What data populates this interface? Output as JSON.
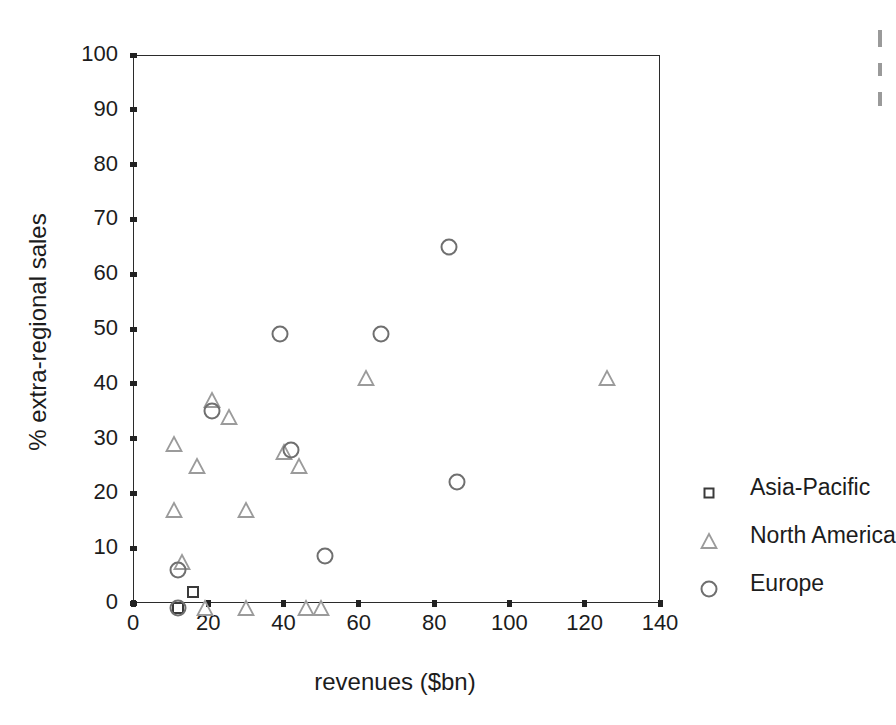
{
  "chart_data": {
    "type": "scatter",
    "title": "",
    "xlabel": "revenues ($bn)",
    "ylabel": "% extra-regional sales",
    "xlim": [
      0,
      140
    ],
    "ylim": [
      0,
      100
    ],
    "xticks": [
      0,
      20,
      40,
      60,
      80,
      100,
      120,
      140
    ],
    "yticks": [
      0,
      10,
      20,
      30,
      40,
      50,
      60,
      70,
      80,
      90,
      100
    ],
    "grid": false,
    "legend_position": "right",
    "series": [
      {
        "name": "Asia-Pacific",
        "marker": "square",
        "color": "#3a3a3a",
        "points": [
          {
            "x": 12,
            "y": -1
          },
          {
            "x": 16,
            "y": 2
          }
        ]
      },
      {
        "name": "North America",
        "marker": "triangle",
        "color": "#9b9b9b",
        "points": [
          {
            "x": 11,
            "y": 29
          },
          {
            "x": 11,
            "y": 17
          },
          {
            "x": 13,
            "y": 7.5
          },
          {
            "x": 17,
            "y": 25
          },
          {
            "x": 21,
            "y": 37
          },
          {
            "x": 25.5,
            "y": 34
          },
          {
            "x": 30,
            "y": 17
          },
          {
            "x": 40,
            "y": 27.5
          },
          {
            "x": 44,
            "y": 25
          },
          {
            "x": 62,
            "y": 41
          },
          {
            "x": 126,
            "y": 41
          },
          {
            "x": 19,
            "y": -1
          },
          {
            "x": 30,
            "y": -1
          },
          {
            "x": 46,
            "y": -1
          },
          {
            "x": 50,
            "y": -1
          }
        ]
      },
      {
        "name": "Europe",
        "marker": "circle",
        "color": "#6f6f6f",
        "points": [
          {
            "x": 12,
            "y": 6
          },
          {
            "x": 21,
            "y": 35
          },
          {
            "x": 39,
            "y": 49
          },
          {
            "x": 42,
            "y": 28
          },
          {
            "x": 51,
            "y": 8.5
          },
          {
            "x": 66,
            "y": 49
          },
          {
            "x": 84,
            "y": 65
          },
          {
            "x": 86,
            "y": 22
          },
          {
            "x": 12,
            "y": -1
          }
        ]
      }
    ]
  },
  "axes": {
    "x_title": "revenues ($bn)",
    "y_title": "% extra-regional sales",
    "x_tick_labels": [
      "0",
      "20",
      "40",
      "60",
      "80",
      "100",
      "120",
      "140"
    ],
    "y_tick_labels": [
      "0",
      "10",
      "20",
      "30",
      "40",
      "50",
      "60",
      "70",
      "80",
      "90",
      "100"
    ]
  },
  "legend": {
    "entries": [
      {
        "label": "Asia-Pacific",
        "marker": "square-marker-icon"
      },
      {
        "label": "North America",
        "marker": "triangle-marker-icon"
      },
      {
        "label": "Europe",
        "marker": "circle-marker-icon"
      }
    ]
  },
  "colors": {
    "axis": "#2b2b2b",
    "text": "#1c1c1c",
    "asia_pacific": "#3a3a3a",
    "north_america": "#9b9b9b",
    "europe": "#6f6f6f",
    "background": "#ffffff"
  }
}
